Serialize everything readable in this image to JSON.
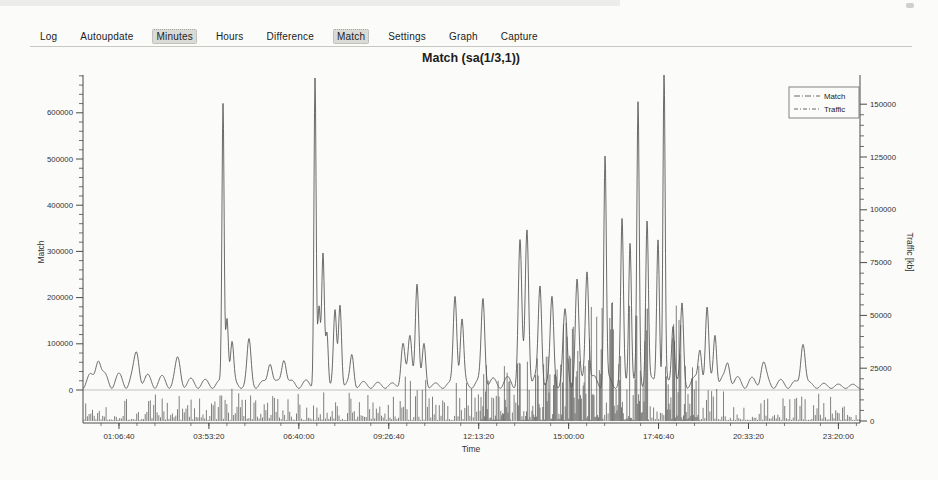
{
  "toolbar": {
    "items": [
      {
        "label": "Log",
        "active": false
      },
      {
        "label": "Autoupdate",
        "active": false
      },
      {
        "label": "Minutes",
        "active": true
      },
      {
        "label": "Hours",
        "active": false
      },
      {
        "label": "Difference",
        "active": false
      },
      {
        "label": "Match",
        "active": true
      },
      {
        "label": "Settings",
        "active": false
      },
      {
        "label": "Graph",
        "active": false
      },
      {
        "label": "Capture",
        "active": false
      }
    ],
    "active_bg_color": "#dadad6"
  },
  "chart_data": {
    "type": "line",
    "title": "Match (sa(1/3,1))",
    "xlabel": "Time",
    "x_range_seconds": [
      0,
      86400
    ],
    "x_ticks": [
      {
        "s": 4000,
        "label": "01:06:40"
      },
      {
        "s": 14000,
        "label": "03:53:20"
      },
      {
        "s": 24000,
        "label": "06:40:00"
      },
      {
        "s": 34000,
        "label": "09:26:40"
      },
      {
        "s": 44000,
        "label": "12:13:20"
      },
      {
        "s": 54000,
        "label": "15:00:00"
      },
      {
        "s": 64000,
        "label": "17:46:40"
      },
      {
        "s": 74000,
        "label": "20:33:20"
      },
      {
        "s": 84000,
        "label": "23:20:00"
      }
    ],
    "x_minor_step_s": 2000,
    "axes": {
      "left": {
        "label": "Match",
        "range": [
          0,
          680000
        ],
        "major_ticks": [
          0,
          100000,
          200000,
          300000,
          400000,
          500000,
          600000
        ],
        "minor_step": 20000
      },
      "right": {
        "label": "Traffic [kb]",
        "range": [
          0,
          152000
        ],
        "major_ticks": [
          0,
          25000,
          50000,
          75000,
          100000,
          125000,
          150000
        ],
        "minor_step": 5000
      }
    },
    "legend": {
      "position": "top-right",
      "entries": [
        "Match",
        "Traffic"
      ]
    },
    "grid": "zero-line-only",
    "series": [
      {
        "name": "Match",
        "axis": "left",
        "style": "line",
        "color": "#5a5a5a",
        "baseline": {
          "period_s": 1600,
          "trough": 3500,
          "bump_peak_range": [
            18000,
            33000
          ]
        },
        "peaks_t_v_w": [
          [
            1670,
            58000,
            280
          ],
          [
            6000,
            60000,
            280
          ],
          [
            10560,
            45000,
            280
          ],
          [
            15570,
            605000,
            120
          ],
          [
            16010,
            150000,
            150
          ],
          [
            16570,
            88000,
            180
          ],
          [
            18460,
            92000,
            220
          ],
          [
            20800,
            52000,
            250
          ],
          [
            22350,
            60000,
            250
          ],
          [
            25800,
            668000,
            120
          ],
          [
            26240,
            158000,
            140
          ],
          [
            26690,
            278000,
            150
          ],
          [
            27130,
            118000,
            140
          ],
          [
            28020,
            152000,
            170
          ],
          [
            28580,
            176000,
            170
          ],
          [
            29910,
            62000,
            200
          ],
          [
            35580,
            92000,
            220
          ],
          [
            36360,
            108000,
            220
          ],
          [
            37140,
            221000,
            190
          ],
          [
            37920,
            90000,
            190
          ],
          [
            41370,
            196000,
            200
          ],
          [
            42140,
            138000,
            190
          ],
          [
            44480,
            187000,
            200
          ],
          [
            48590,
            298000,
            190
          ],
          [
            49370,
            337000,
            190
          ],
          [
            50820,
            207000,
            190
          ],
          [
            52150,
            171000,
            190
          ],
          [
            53600,
            142000,
            220
          ],
          [
            54930,
            214000,
            190
          ],
          [
            56040,
            252000,
            190
          ],
          [
            58050,
            487000,
            140
          ],
          [
            59940,
            343000,
            150
          ],
          [
            60830,
            314000,
            150
          ],
          [
            61720,
            598000,
            130
          ],
          [
            62720,
            354000,
            150
          ],
          [
            63940,
            321000,
            150
          ],
          [
            64610,
            669000,
            120
          ],
          [
            65610,
            134000,
            170
          ],
          [
            66610,
            164000,
            170
          ],
          [
            68610,
            79000,
            200
          ],
          [
            69390,
            154000,
            180
          ],
          [
            70280,
            113000,
            180
          ],
          [
            71720,
            46000,
            240
          ],
          [
            75620,
            43000,
            280
          ],
          [
            80060,
            95000,
            240
          ]
        ]
      },
      {
        "name": "Traffic",
        "axis": "right",
        "style": "impulse",
        "color": "#4f4f4f",
        "noise_max_default": 13000,
        "bursts_t0_t1_max": [
          [
            15000,
            17200,
            18000
          ],
          [
            24500,
            30500,
            19000
          ],
          [
            35200,
            39500,
            21000
          ],
          [
            40500,
            43500,
            18000
          ],
          [
            44000,
            47500,
            26000
          ],
          [
            48200,
            52300,
            32000
          ],
          [
            52300,
            57800,
            54000
          ],
          [
            58400,
            62800,
            60000
          ],
          [
            64700,
            66500,
            60000
          ],
          [
            66500,
            68500,
            26000
          ],
          [
            69000,
            71500,
            18000
          ]
        ]
      }
    ]
  }
}
